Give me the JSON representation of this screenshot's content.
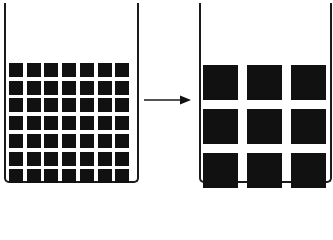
{
  "diagram": {
    "colors": {
      "block": "#111111",
      "outline": "#1a1a1a",
      "background": "#ffffff"
    },
    "left_container": {
      "grid_rows": 7,
      "grid_cols": 7,
      "block_count": 49,
      "block_size_px": 14,
      "block_pitch_px": 17.7
    },
    "arrow": {
      "direction": "right",
      "icon": "right-arrow-icon"
    },
    "right_container": {
      "grid_rows": 3,
      "grid_cols": 3,
      "block_count": 9,
      "block_size_px": 35,
      "block_pitch_px": 44
    }
  }
}
